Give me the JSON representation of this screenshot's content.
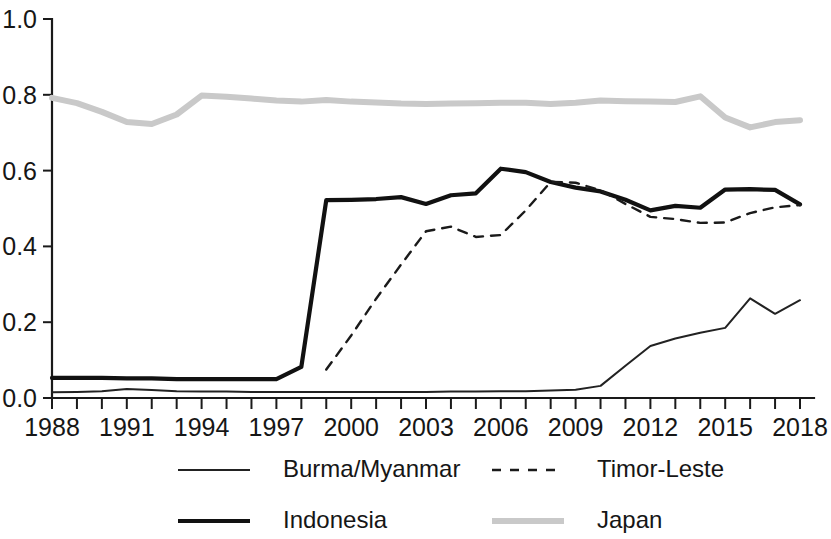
{
  "chart_data": {
    "type": "line",
    "title": "",
    "subtitle": "",
    "xlabel": "",
    "ylabel": "",
    "xlim": [
      1988,
      2018
    ],
    "ylim": [
      0.0,
      1.0
    ],
    "grid": false,
    "legend_position": "bottom",
    "x_tick_labels": [
      "1988",
      "1991",
      "1994",
      "1997",
      "2000",
      "2003",
      "2006",
      "2009",
      "2012",
      "2015",
      "2018"
    ],
    "x_tick_values": [
      1988,
      1991,
      1994,
      1997,
      2000,
      2003,
      2006,
      2009,
      2012,
      2015,
      2018
    ],
    "x_minor_ticks": [
      1988,
      1989,
      1990,
      1991,
      1992,
      1993,
      1994,
      1995,
      1996,
      1997,
      1998,
      1999,
      2000,
      2001,
      2002,
      2003,
      2004,
      2005,
      2006,
      2007,
      2008,
      2009,
      2010,
      2011,
      2012,
      2013,
      2014,
      2015,
      2016,
      2017,
      2018
    ],
    "y_tick_labels": [
      "0.0",
      "0.2",
      "0.4",
      "0.6",
      "0.8",
      "1.0"
    ],
    "y_tick_values": [
      0.0,
      0.2,
      0.4,
      0.6,
      0.8,
      1.0
    ],
    "x": [
      1988,
      1989,
      1990,
      1991,
      1992,
      1993,
      1994,
      1995,
      1996,
      1997,
      1998,
      1999,
      2000,
      2001,
      2002,
      2003,
      2004,
      2005,
      2006,
      2007,
      2008,
      2009,
      2010,
      2011,
      2012,
      2013,
      2014,
      2015,
      2016,
      2017,
      2018
    ],
    "series": [
      {
        "name": "Burma/Myanmar",
        "style": "thin-solid",
        "color": "#222222",
        "width": 2,
        "x": [
          1988,
          1989,
          1990,
          1991,
          1992,
          1993,
          1994,
          1995,
          1996,
          1997,
          1998,
          1999,
          2000,
          2001,
          2002,
          2003,
          2004,
          2005,
          2006,
          2007,
          2008,
          2009,
          2010,
          2011,
          2012,
          2013,
          2014,
          2015,
          2016,
          2017,
          2018
        ],
        "values": [
          0.015,
          0.016,
          0.018,
          0.024,
          0.021,
          0.018,
          0.017,
          0.017,
          0.016,
          0.016,
          0.016,
          0.016,
          0.016,
          0.016,
          0.016,
          0.016,
          0.017,
          0.017,
          0.018,
          0.018,
          0.02,
          0.022,
          0.032,
          0.085,
          0.137,
          0.157,
          0.172,
          0.185,
          0.263,
          0.222,
          0.258
        ]
      },
      {
        "name": "Indonesia",
        "style": "thick-solid",
        "color": "#111111",
        "width": 4.2,
        "x": [
          1988,
          1989,
          1990,
          1991,
          1992,
          1993,
          1994,
          1995,
          1996,
          1997,
          1998,
          1999,
          2000,
          2001,
          2002,
          2003,
          2004,
          2005,
          2006,
          2007,
          2008,
          2009,
          2010,
          2011,
          2012,
          2013,
          2014,
          2015,
          2016,
          2017,
          2018
        ],
        "values": [
          0.053,
          0.053,
          0.053,
          0.052,
          0.052,
          0.05,
          0.05,
          0.05,
          0.05,
          0.05,
          0.082,
          0.522,
          0.523,
          0.525,
          0.53,
          0.512,
          0.535,
          0.54,
          0.605,
          0.596,
          0.57,
          0.555,
          0.545,
          0.523,
          0.495,
          0.507,
          0.502,
          0.55,
          0.551,
          0.549,
          0.511
        ]
      },
      {
        "name": "Timor-Leste",
        "style": "dashed",
        "color": "#1a1a1a",
        "width": 2.4,
        "x": [
          1999,
          2000,
          2001,
          2002,
          2003,
          2004,
          2005,
          2006,
          2007,
          2008,
          2009,
          2010,
          2011,
          2012,
          2013,
          2014,
          2015,
          2016,
          2017,
          2018
        ],
        "values": [
          0.075,
          0.165,
          0.262,
          0.352,
          0.44,
          0.452,
          0.425,
          0.43,
          0.495,
          0.57,
          0.568,
          0.548,
          0.512,
          0.478,
          0.472,
          0.462,
          0.463,
          0.488,
          0.503,
          0.509
        ]
      },
      {
        "name": "Japan",
        "style": "thick-gray",
        "color": "#c9c9c9",
        "width": 6,
        "x": [
          1988,
          1989,
          1990,
          1991,
          1992,
          1993,
          1994,
          1995,
          1996,
          1997,
          1998,
          1999,
          2000,
          2001,
          2002,
          2003,
          2004,
          2005,
          2006,
          2007,
          2008,
          2009,
          2010,
          2011,
          2012,
          2013,
          2014,
          2015,
          2016,
          2017,
          2018
        ],
        "values": [
          0.792,
          0.778,
          0.755,
          0.728,
          0.723,
          0.748,
          0.798,
          0.795,
          0.79,
          0.785,
          0.782,
          0.786,
          0.782,
          0.78,
          0.777,
          0.776,
          0.777,
          0.778,
          0.779,
          0.779,
          0.776,
          0.779,
          0.785,
          0.783,
          0.782,
          0.781,
          0.796,
          0.74,
          0.714,
          0.728,
          0.733
        ]
      }
    ]
  },
  "legend": {
    "entries": [
      {
        "label": "Burma/Myanmar",
        "style": "thin-solid"
      },
      {
        "label": "Timor-Leste",
        "style": "dashed"
      },
      {
        "label": "Indonesia",
        "style": "thick-solid"
      },
      {
        "label": "Japan",
        "style": "thick-gray"
      }
    ]
  }
}
